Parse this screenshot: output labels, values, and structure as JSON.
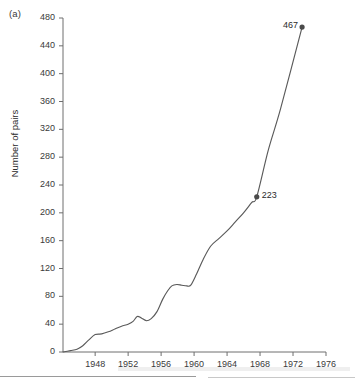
{
  "figure": {
    "panel_label": "(a)",
    "background_color": "#ffffff",
    "line_color": "#5a5a5a",
    "axis_color": "#6e6e6e",
    "text_color": "#2b2b2b"
  },
  "chart_data": {
    "type": "line",
    "title": "",
    "subtitle": "",
    "panel": "(a)",
    "xlabel": "",
    "ylabel": "Number of pairs",
    "xlim": [
      1944.1,
      1976.0
    ],
    "ylim": [
      0,
      480
    ],
    "xticks": [
      1948,
      1952,
      1956,
      1960,
      1964,
      1968,
      1972,
      1976
    ],
    "xtick_labels": [
      "1948",
      "1952",
      "1956",
      "1960",
      "1964",
      "1968",
      "1972",
      "1976"
    ],
    "yticks": [
      0,
      40,
      80,
      120,
      160,
      200,
      240,
      280,
      320,
      360,
      400,
      440,
      480
    ],
    "ytick_labels": [
      "0",
      "40",
      "80",
      "120",
      "160",
      "200",
      "240",
      "280",
      "320",
      "360",
      "400",
      "440",
      "480"
    ],
    "grid": false,
    "legend": null,
    "legend_position": "none",
    "series": [
      {
        "name": "Number of pairs",
        "color": "#5a5a5a",
        "x": [
          1944.1,
          1945.0,
          1945.8,
          1946.5,
          1947.2,
          1948.0,
          1948.8,
          1949.6,
          1950.4,
          1951.2,
          1952.0,
          1952.6,
          1953.1,
          1953.6,
          1954.2,
          1954.8,
          1955.5,
          1956.2,
          1956.8,
          1957.3,
          1957.9,
          1958.5,
          1959.1,
          1959.6,
          1960.3,
          1961.1,
          1962.0,
          1963.0,
          1964.0,
          1965.0,
          1966.0,
          1967.0,
          1967.6,
          1969.0,
          1970.5,
          1973.1
        ],
        "y": [
          0,
          2,
          4,
          9,
          17,
          25,
          26,
          29,
          33,
          37,
          40,
          44,
          51,
          49,
          45,
          48,
          58,
          76,
          88,
          95,
          97,
          96,
          95,
          96,
          112,
          133,
          152,
          163,
          174,
          187,
          200,
          215,
          223,
          290,
          350,
          467
        ]
      }
    ],
    "markers": [
      {
        "x": 1967.6,
        "y": 223,
        "label": "223",
        "label_position": "right"
      },
      {
        "x": 1973.1,
        "y": 467,
        "label": "467",
        "label_position": "left"
      }
    ],
    "annotations": [
      {
        "text": "(a)",
        "position": "top-left"
      }
    ]
  },
  "layout": {
    "axis_origin_px": {
      "x": 63,
      "y": 352
    },
    "y_top_px": 18,
    "x_right_px": 326
  }
}
